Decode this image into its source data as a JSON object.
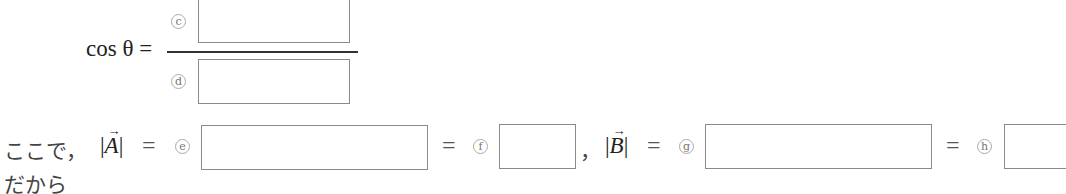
{
  "formula": {
    "lhs": "cos θ =",
    "numerator_label": "c",
    "denominator_label": "d"
  },
  "line2": {
    "prefix": "ここで，",
    "vec_a": "A",
    "eq1": "=",
    "label_e": "e",
    "eq2": "=",
    "label_f": "f",
    "separator": "，",
    "vec_b": "B",
    "eq3": "=",
    "label_g": "g",
    "eq4": "=",
    "label_h": "h",
    "arrow": "→",
    "bar": "|"
  },
  "line3": {
    "text": "だから"
  },
  "answer_boxes": {
    "c": "",
    "d": "",
    "e": "",
    "f": "",
    "g": "",
    "h": ""
  }
}
